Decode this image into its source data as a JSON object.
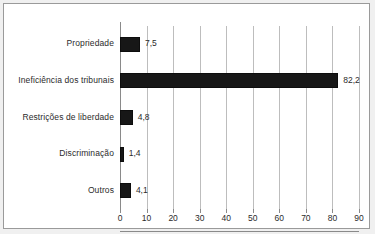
{
  "chart_data": {
    "type": "bar",
    "orientation": "horizontal",
    "title": "",
    "xlabel": "",
    "ylabel": "",
    "categories": [
      "Propriedade",
      "Ineficiência dos tribunais",
      "Restrições de liberdade",
      "Discriminação",
      "Outros"
    ],
    "values": [
      7.5,
      82.2,
      4.8,
      1.4,
      4.1
    ],
    "value_labels": [
      "7,5",
      "82,2",
      "4,8",
      "1,4",
      "4,1"
    ],
    "xlim": [
      0,
      90
    ],
    "xticks": [
      0,
      10,
      20,
      30,
      40,
      50,
      60,
      70,
      80,
      90
    ],
    "xtick_labels": [
      "0",
      "10",
      "20",
      "30",
      "40",
      "50",
      "60",
      "70",
      "80",
      "90"
    ],
    "grid": true,
    "grid_axis": "x",
    "legend": false,
    "bar_color": "#171717",
    "grid_color": "#bdbdbd",
    "axis_color": "#8a8a8a",
    "background": "#ffffff",
    "frame_color": "#9a9a9a",
    "decimal_separator": ","
  }
}
